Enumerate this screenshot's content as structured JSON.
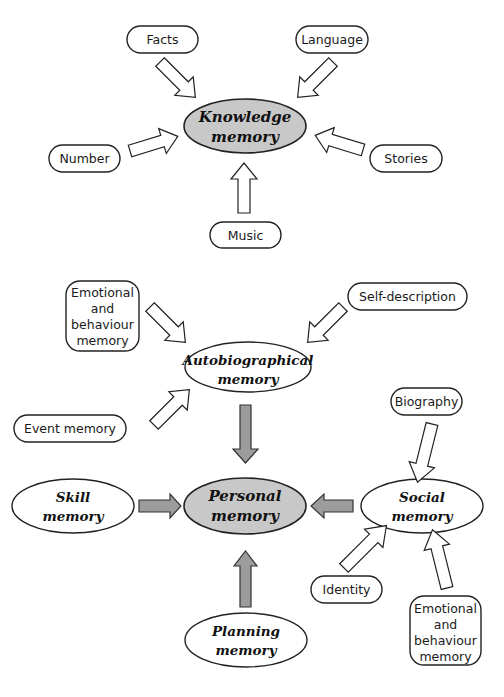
{
  "diagram": {
    "top_cut_text": "",
    "knowledge": {
      "center": {
        "line1": "Knowledge",
        "line2": "memory"
      },
      "inputs": {
        "facts": "Facts",
        "language": "Language",
        "number": "Number",
        "stories": "Stories",
        "music": "Music"
      }
    },
    "personal": {
      "center": {
        "line1": "Personal",
        "line2": "memory"
      },
      "autobiographical": {
        "line1": "Autobiographical",
        "line2": "memory"
      },
      "skill": {
        "line1": "Skill",
        "line2": "memory"
      },
      "social": {
        "line1": "Social",
        "line2": "memory"
      },
      "planning": {
        "line1": "Planning",
        "line2": "memory"
      },
      "auto_inputs": {
        "emotional": [
          "Emotional",
          "and",
          "behaviour",
          "memory"
        ],
        "self_description": "Self-description",
        "event_memory": "Event memory"
      },
      "social_inputs": {
        "biography": "Biography",
        "identity": "Identity",
        "emotional": [
          "Emotional",
          "and",
          "behaviour",
          "memory"
        ]
      }
    },
    "colors": {
      "core_fill": "#c8c8c8",
      "arrow_gray": "#9c9c9c",
      "stroke": "#222222"
    }
  }
}
